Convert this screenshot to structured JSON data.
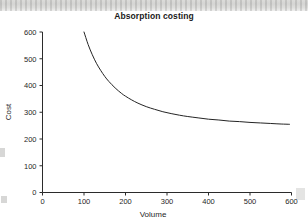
{
  "chart_data": {
    "type": "line",
    "title": "Absorption costing",
    "xlabel": "Volume",
    "ylabel": "Cost",
    "xlim": [
      0,
      600
    ],
    "ylim": [
      0,
      600
    ],
    "grid": false,
    "legend": null,
    "xticks": [
      "0",
      "100",
      "200",
      "300",
      "400",
      "500",
      "600"
    ],
    "yticks": [
      "0",
      "100",
      "200",
      "300",
      "400",
      "500",
      "600"
    ],
    "xtick_values": [
      0,
      100,
      200,
      300,
      400,
      500,
      600
    ],
    "ytick_values": [
      0,
      100,
      200,
      300,
      400,
      500,
      600
    ],
    "series": [
      {
        "name": "Absorption cost per unit",
        "note": "Hyperbolic: fixed cost spread over volume plus variable cost, asymptote near 200",
        "x": [
          100,
          110,
          120,
          130,
          140,
          150,
          160,
          175,
          190,
          200,
          215,
          230,
          250,
          270,
          290,
          310,
          330,
          350,
          375,
          400,
          425,
          450,
          475,
          500,
          525,
          550,
          575,
          595
        ],
        "y": [
          600,
          553,
          515,
          483,
          457,
          434,
          415,
          391,
          371,
          360,
          346,
          334,
          321,
          311,
          302,
          295,
          289,
          284,
          279,
          274,
          271,
          267,
          265,
          262,
          260,
          258,
          256,
          255
        ]
      }
    ]
  },
  "artifacts": {
    "scan_band_label": "scan-artifact-band",
    "background_color": "#ffffff",
    "ink_color": "#242424"
  }
}
